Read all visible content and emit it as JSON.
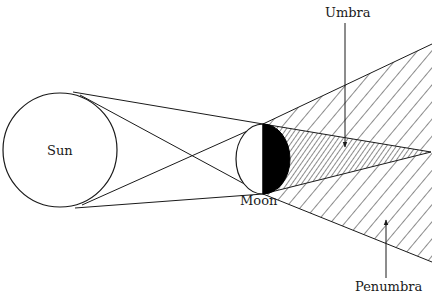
{
  "diagram": {
    "labels": {
      "sun": "Sun",
      "moon": "Moon",
      "umbra": "Umbra",
      "penumbra": "Penumbra"
    },
    "colors": {
      "stroke": "#1a1a1a",
      "background": "#ffffff",
      "moon_shadow": "#000000"
    },
    "shapes": {
      "sun": {
        "cx": 60,
        "cy": 150,
        "r": 57
      },
      "moon": {
        "cx": 263,
        "cy": 159,
        "r": 35
      },
      "umbra_apex": {
        "x": 431,
        "y": 152
      },
      "penumbra_upper_end": {
        "x": 432,
        "y": 44
      },
      "penumbra_lower_end": {
        "x": 432,
        "y": 262
      }
    }
  }
}
